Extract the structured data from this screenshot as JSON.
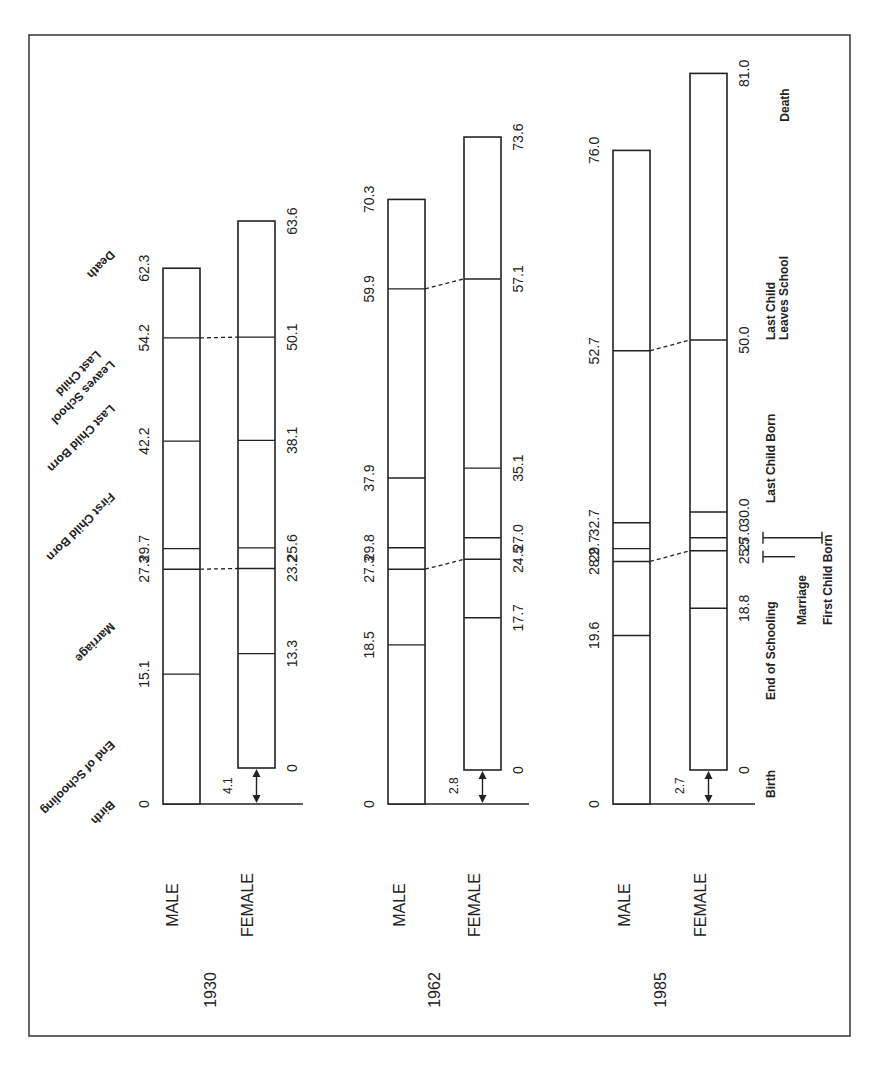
{
  "chart_data": {
    "type": "bar",
    "orientation": "rotated (bars grow upward, labels rotated)",
    "stages": [
      "Birth",
      "End of Schooling",
      "Marriage",
      "First Child Born",
      "Last Child Born",
      "Last Child Leaves School",
      "Death"
    ],
    "groups": [
      {
        "year": "1930",
        "series": [
          {
            "name": "MALE",
            "offset": 0,
            "values": [
              0,
              15.1,
              27.3,
              29.7,
              42.2,
              54.2,
              62.3
            ]
          },
          {
            "name": "FEMALE",
            "offset": 4.1,
            "values": [
              0,
              13.3,
              23.2,
              25.6,
              38.1,
              50.1,
              63.6
            ]
          }
        ],
        "age_gap_label": "4.1"
      },
      {
        "year": "1962",
        "series": [
          {
            "name": "MALE",
            "offset": 0,
            "values": [
              0,
              18.5,
              27.3,
              29.8,
              37.9,
              59.9,
              70.3
            ]
          },
          {
            "name": "FEMALE",
            "offset": 2.8,
            "values": [
              0,
              17.7,
              24.5,
              27.0,
              35.1,
              57.1,
              73.6
            ]
          }
        ],
        "age_gap_label": "2.8"
      },
      {
        "year": "1985",
        "series": [
          {
            "name": "MALE",
            "offset": 0,
            "values": [
              0,
              19.6,
              28.2,
              29.7,
              32.7,
              52.7,
              76.0
            ]
          },
          {
            "name": "FEMALE",
            "offset": 2.7,
            "values": [
              0,
              18.8,
              25.5,
              27.0,
              30.0,
              50.0,
              81.0
            ]
          }
        ],
        "age_gap_label": "2.7"
      }
    ],
    "xlabel": "",
    "ylabel": "Age (years)",
    "ylim": [
      0,
      81
    ]
  },
  "labels": {
    "male": "MALE",
    "female": "FEMALE",
    "years": [
      "1930",
      "1962",
      "1985"
    ],
    "stage_labels_1930": [
      "Birth",
      "End of Schooling",
      "Marriage",
      "First Child Born",
      "Last Child Born",
      "Last Child Leaves School",
      "Death"
    ],
    "stage_labels_1985": {
      "birth": "Birth",
      "end_schooling": "End of Schooling",
      "marriage": "Marriage",
      "first_child": "First Child Born",
      "last_child": "Last Child Born",
      "last_leaves_1": "Last Child",
      "last_leaves_2": "Leaves School",
      "death": "Death"
    }
  },
  "male_values_text": {
    "g0": [
      "0",
      "15.1",
      "27.3",
      "29.7",
      "42.2",
      "54.2",
      "62.3"
    ],
    "g1": [
      "0",
      "18.5",
      "27.3",
      "29.8",
      "37.9",
      "59.9",
      "70.3"
    ],
    "g2": [
      "0",
      "19.6",
      "28.2",
      "29.7",
      "32.7",
      "52.7",
      "76.0"
    ]
  },
  "female_values_text": {
    "g0": [
      "0",
      "13.3",
      "23.2",
      "25.6",
      "38.1",
      "50.1",
      "63.6"
    ],
    "g1": [
      "0",
      "17.7",
      "24.5",
      "27.0",
      "35.1",
      "57.1",
      "73.6"
    ],
    "g2": [
      "0",
      "18.8",
      "25.5",
      "27.0",
      "30.0",
      "50.0",
      "81.0"
    ]
  },
  "colors": {
    "ink": "#222222",
    "background": "#ffffff"
  }
}
